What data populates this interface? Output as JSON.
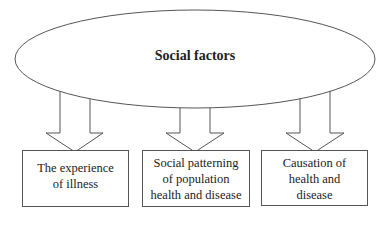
{
  "diagram": {
    "root": {
      "label": "Social factors"
    },
    "children": [
      {
        "lines": [
          "The experience",
          "of illness"
        ]
      },
      {
        "lines": [
          "Social patterning",
          "of population",
          "health and disease"
        ]
      },
      {
        "lines": [
          "Causation of",
          "health and",
          "disease"
        ]
      }
    ],
    "colors": {
      "stroke": "#555555",
      "text": "#222222",
      "background": "#ffffff"
    }
  }
}
